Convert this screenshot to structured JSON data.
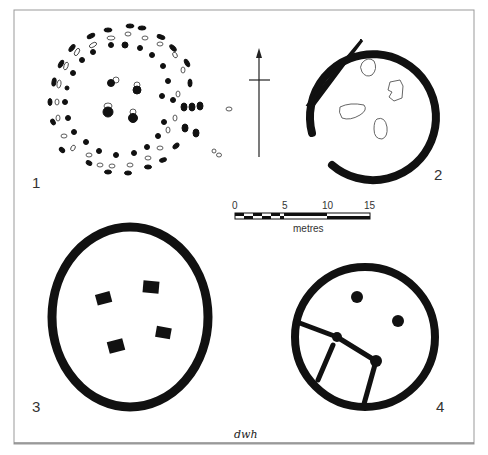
{
  "figure": {
    "panels": [
      {
        "id": "1",
        "label": "1",
        "description": "post-ring plan, concentric rings of postholes"
      },
      {
        "id": "2",
        "label": "2",
        "description": "penannular ring-groove with hearth stones"
      },
      {
        "id": "3",
        "label": "3",
        "description": "ring-groove with four internal posts"
      },
      {
        "id": "4",
        "label": "4",
        "description": "ring-groove with internal posts and rectangular partition"
      }
    ],
    "north_arrow": {
      "label": "north-arrow"
    },
    "scale_bar": {
      "ticks": [
        "0",
        "5",
        "10",
        "15"
      ],
      "unit": "metres"
    },
    "signature": "dwh"
  }
}
